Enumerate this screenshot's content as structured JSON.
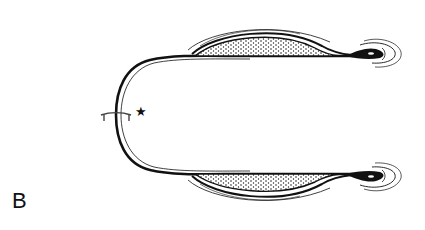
{
  "figure": {
    "panel_label": "B",
    "marker_symbol": "★",
    "colors": {
      "ink": "#111111",
      "background": "#ffffff"
    }
  }
}
